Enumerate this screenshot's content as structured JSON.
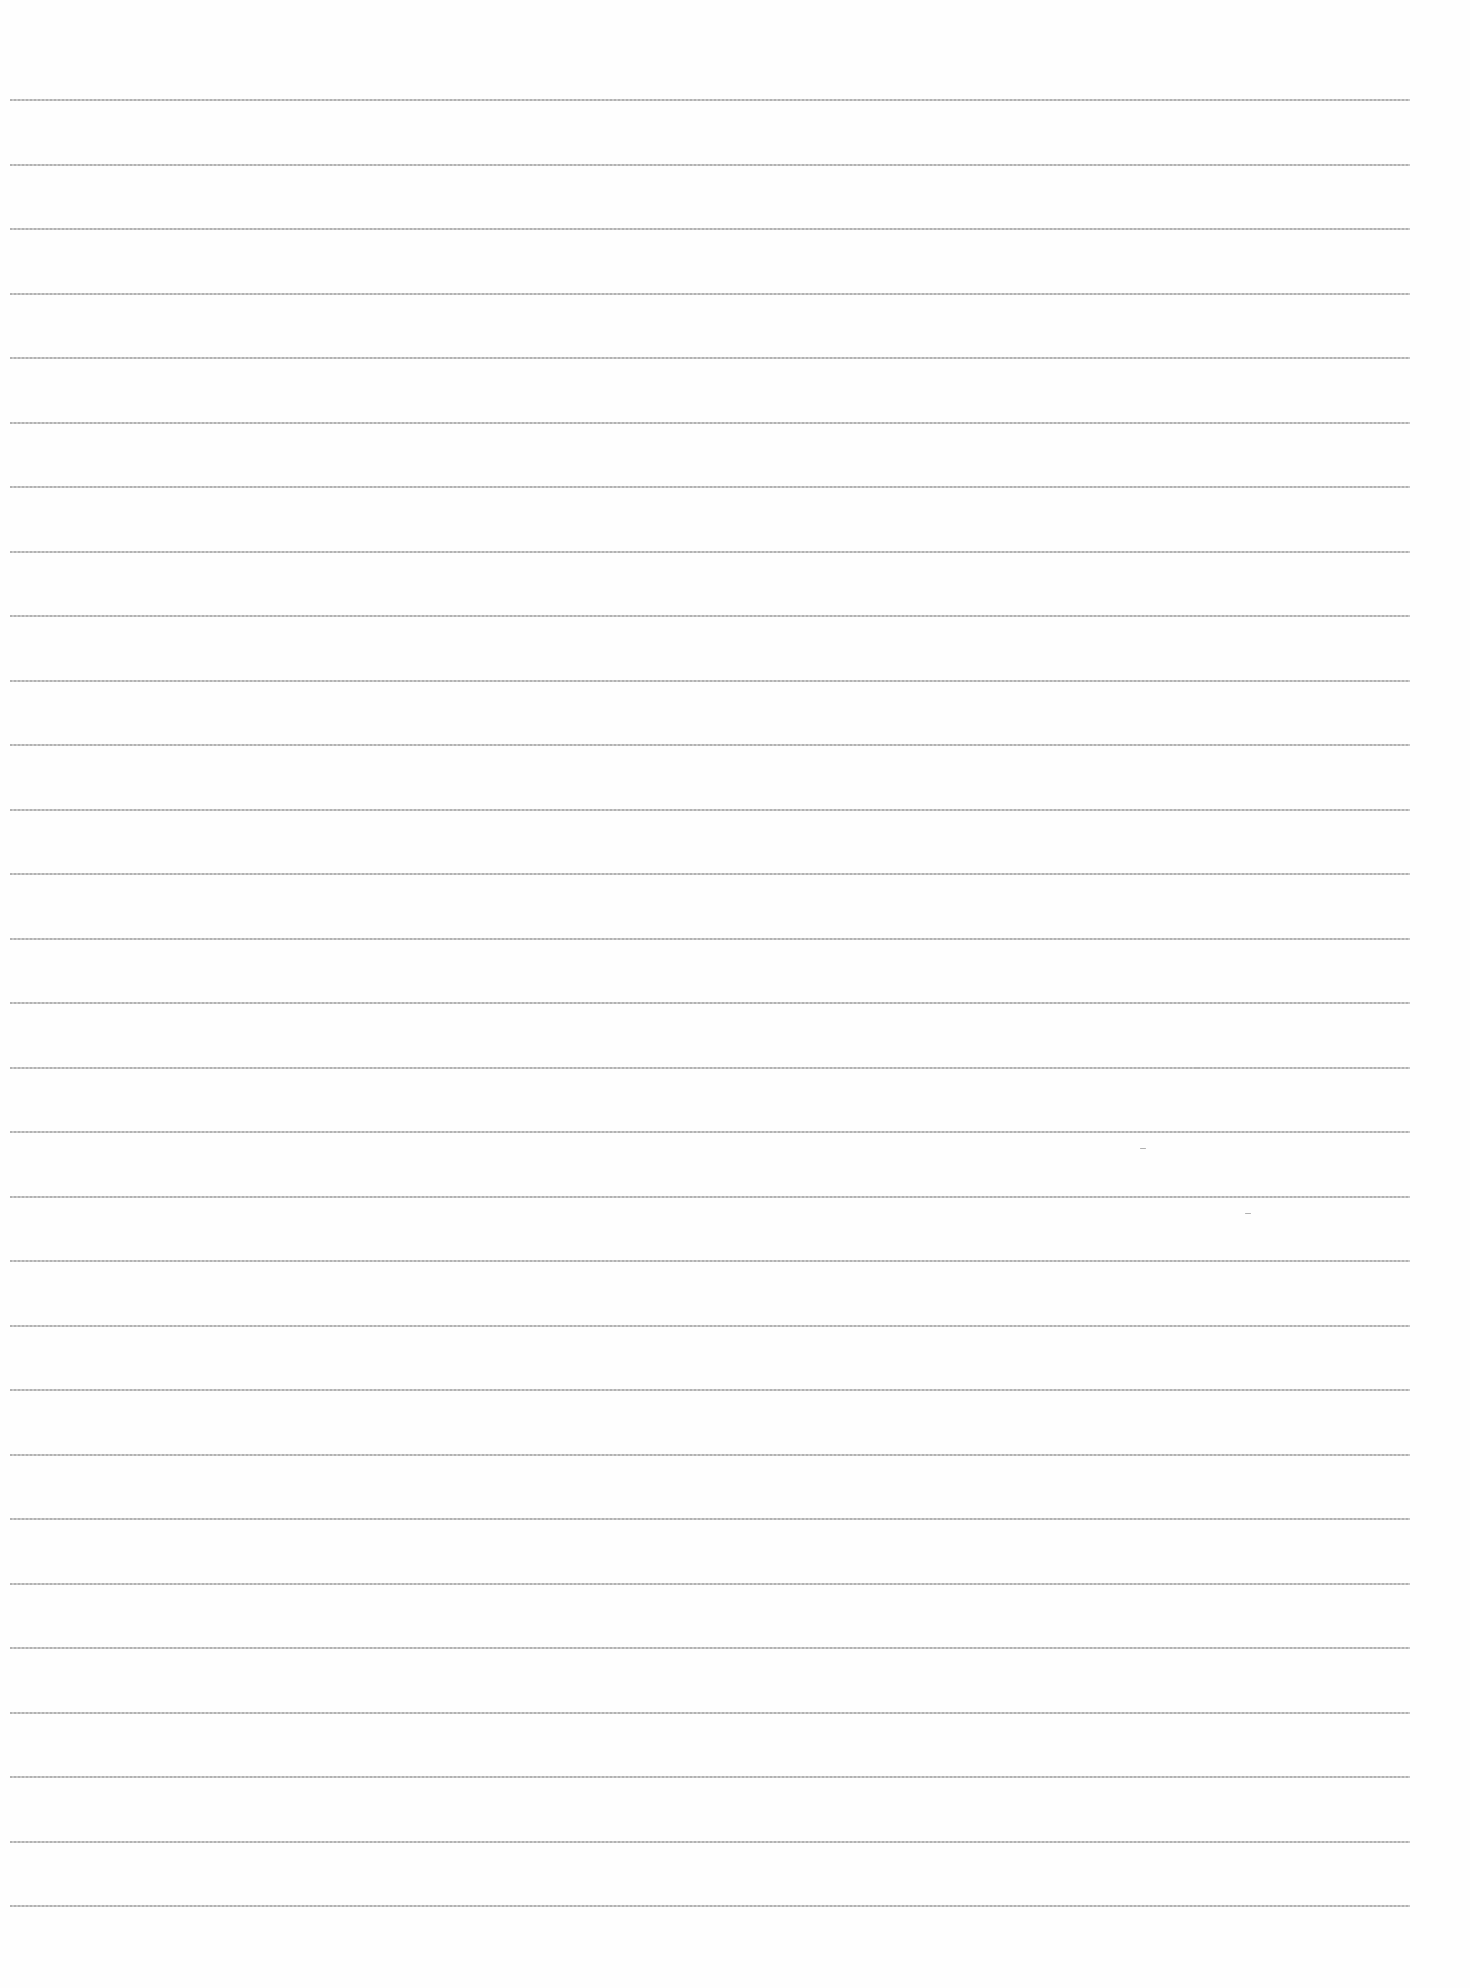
{
  "document": {
    "type": "blank lined paper",
    "text_content": "",
    "rule_color": "#b0b0b0",
    "background_color": "#fefefe",
    "rules": {
      "count": 29,
      "first_y": 99,
      "spacing": 64.5,
      "left_x": 10,
      "width": 1400
    }
  }
}
